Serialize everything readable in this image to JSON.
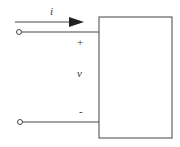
{
  "diagram": {
    "current_label": "i",
    "positive_terminal": "+",
    "voltage_label": "v",
    "negative_terminal": "-",
    "colors": {
      "stroke": "#444444",
      "background": "#ffffff"
    }
  }
}
